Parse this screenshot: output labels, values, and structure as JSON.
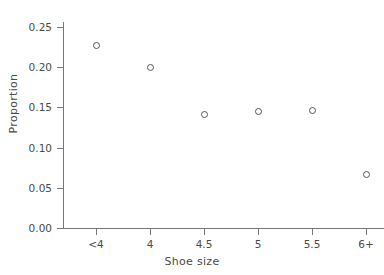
{
  "figure": {
    "cropped_title_fragment": "",
    "background_color": "#ffffff",
    "axis_color": "#777777",
    "marker_color": "#555555"
  },
  "chart_data": {
    "type": "scatter",
    "title": "",
    "xlabel": "Shoe size",
    "ylabel": "Proportion",
    "categories": [
      "<4",
      "4",
      "4.5",
      "5",
      "5.5",
      "6+"
    ],
    "values": [
      0.227,
      0.2,
      0.142,
      0.146,
      0.147,
      0.067
    ],
    "series": [
      {
        "name": "Proportion",
        "values": [
          0.227,
          0.2,
          0.142,
          0.146,
          0.147,
          0.067
        ]
      }
    ],
    "ylim": [
      0.0,
      0.25
    ],
    "ytick_labels": [
      "0.00",
      "0.05",
      "0.10",
      "0.15",
      "0.20",
      "0.25"
    ],
    "ytick_values": [
      0.0,
      0.05,
      0.1,
      0.15,
      0.2,
      0.25
    ],
    "xtick_labels": [
      "<4",
      "4",
      "4.5",
      "5",
      "5.5",
      "6+"
    ],
    "grid": false,
    "legend": false,
    "marker": "open-circle"
  }
}
